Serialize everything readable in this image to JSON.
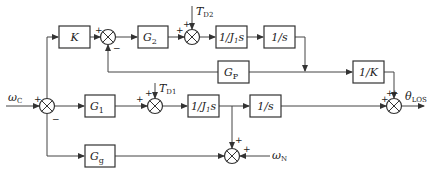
{
  "blocks": {
    "K": "K",
    "G2": "G",
    "G2_sub": "2",
    "J1s_top": "1/J",
    "J1s_top_sub": "1",
    "J1s_top_s": "s",
    "integ_top": "1/s",
    "Gp": "G",
    "Gp_sub": "P",
    "invK": "1/K",
    "G1": "G",
    "G1_sub": "1",
    "J1s_bot": "1/J",
    "J1s_bot_sub": "1",
    "J1s_bot_s": "s",
    "integ_bot": "1/s",
    "Gg": "G",
    "Gg_sub": "g"
  },
  "signals": {
    "input": "ω",
    "input_sub": "C",
    "disturb_top": "T",
    "disturb_top_sub": "D2",
    "disturb_bot": "T",
    "disturb_bot_sub": "D1",
    "noise": "ω",
    "noise_sub": "N",
    "output": "θ",
    "output_sub": "LOS"
  },
  "signs": {
    "plus": "+",
    "minus": "−"
  }
}
